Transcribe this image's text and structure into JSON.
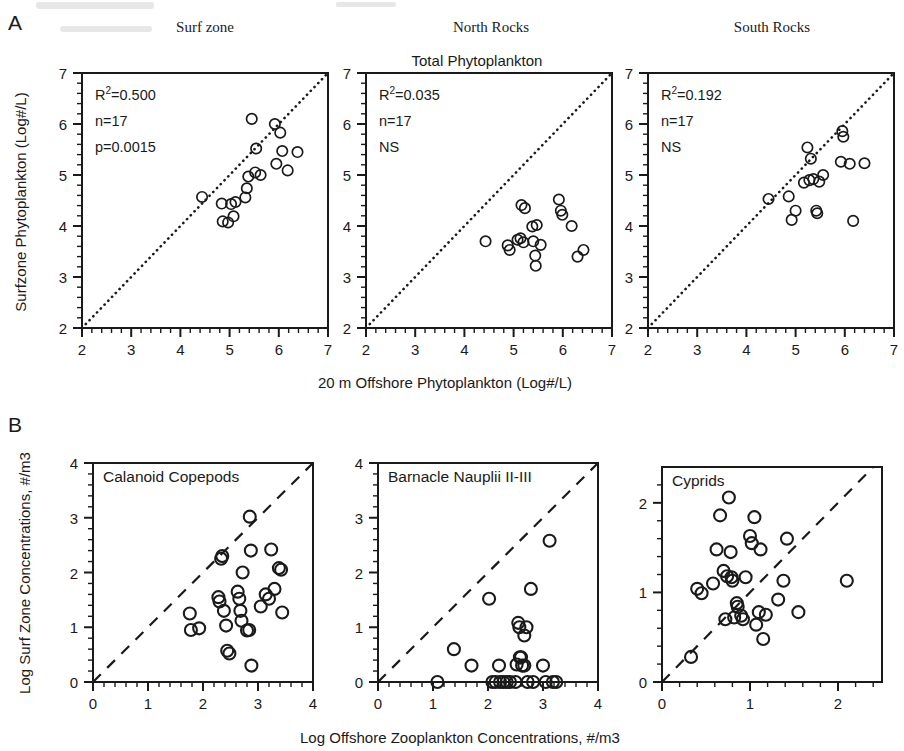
{
  "figure": {
    "panel_a_letter": "A",
    "panel_b_letter": "B",
    "accent_color": "#1a1a1a",
    "background_color": "#ffffff"
  },
  "chart_data": [
    {
      "id": "a1",
      "type": "scatter",
      "title": "Surf zone",
      "supra_title": "",
      "xlabel": "20 m Offshore Phytoplankton  (Log#/L)",
      "ylabel": "Surfzone Phytoplankton  (Log#/L)",
      "xlim": [
        2,
        7
      ],
      "ylim": [
        2,
        7
      ],
      "xticks": [
        2,
        3,
        4,
        5,
        6,
        7
      ],
      "yticks": [
        2,
        3,
        4,
        5,
        6,
        7
      ],
      "minor_ticks_per_interval": 5,
      "grid": false,
      "reference_line": {
        "style": "dotted",
        "from": [
          2,
          2
        ],
        "to": [
          7,
          7
        ],
        "label": "1:1 line"
      },
      "annotations": [
        "R2=0.500",
        "n=17",
        "p=0.0015"
      ],
      "stats": {
        "r_squared": "0.500",
        "n": "17",
        "p": "0.0015",
        "significance": ""
      },
      "points": [
        [
          4.44,
          4.57
        ],
        [
          4.84,
          4.44
        ],
        [
          4.86,
          4.09
        ],
        [
          4.97,
          4.07
        ],
        [
          5.03,
          4.43
        ],
        [
          5.08,
          4.19
        ],
        [
          5.12,
          4.47
        ],
        [
          5.32,
          4.56
        ],
        [
          5.35,
          4.74
        ],
        [
          5.38,
          4.97
        ],
        [
          5.45,
          6.1
        ],
        [
          5.52,
          5.05
        ],
        [
          5.54,
          5.52
        ],
        [
          5.63,
          5.0
        ],
        [
          5.92,
          6.0
        ],
        [
          5.95,
          5.22
        ],
        [
          6.03,
          5.83
        ],
        [
          6.07,
          5.47
        ],
        [
          6.18,
          5.09
        ],
        [
          6.38,
          5.45
        ]
      ]
    },
    {
      "id": "a2",
      "type": "scatter",
      "title": "North Rocks",
      "supra_title": "Total Phytoplankton",
      "xlabel": "20 m Offshore Phytoplankton  (Log#/L)",
      "ylabel": "",
      "xlim": [
        2,
        7
      ],
      "ylim": [
        2,
        7
      ],
      "xticks": [
        2,
        3,
        4,
        5,
        6,
        7
      ],
      "yticks": [
        2,
        3,
        4,
        5,
        6,
        7
      ],
      "minor_ticks_per_interval": 5,
      "grid": false,
      "reference_line": {
        "style": "dotted",
        "from": [
          2,
          2
        ],
        "to": [
          7,
          7
        ],
        "label": "1:1 line"
      },
      "annotations": [
        "R2=0.035",
        "n=17",
        "NS"
      ],
      "stats": {
        "r_squared": "0.035",
        "n": "17",
        "p": "",
        "significance": "NS"
      },
      "points": [
        [
          4.43,
          3.7
        ],
        [
          4.88,
          3.62
        ],
        [
          4.92,
          3.53
        ],
        [
          5.08,
          3.73
        ],
        [
          5.14,
          3.76
        ],
        [
          5.16,
          4.41
        ],
        [
          5.23,
          4.35
        ],
        [
          5.2,
          3.68
        ],
        [
          5.38,
          3.99
        ],
        [
          5.47,
          4.02
        ],
        [
          5.4,
          3.7
        ],
        [
          5.44,
          3.42
        ],
        [
          5.45,
          3.22
        ],
        [
          5.55,
          3.63
        ],
        [
          5.92,
          4.52
        ],
        [
          5.96,
          4.3
        ],
        [
          5.99,
          4.22
        ],
        [
          6.18,
          4.0
        ],
        [
          6.3,
          3.4
        ],
        [
          6.42,
          3.53
        ]
      ]
    },
    {
      "id": "a3",
      "type": "scatter",
      "title": "South Rocks",
      "supra_title": "",
      "xlabel": "20 m Offshore Phytoplankton  (Log#/L)",
      "ylabel": "",
      "xlim": [
        2,
        7
      ],
      "ylim": [
        2,
        7
      ],
      "xticks": [
        2,
        3,
        4,
        5,
        6,
        7
      ],
      "yticks": [
        2,
        3,
        4,
        5,
        6,
        7
      ],
      "minor_ticks_per_interval": 5,
      "grid": false,
      "reference_line": {
        "style": "dotted",
        "from": [
          2,
          2
        ],
        "to": [
          7,
          7
        ],
        "label": "1:1 line"
      },
      "annotations": [
        "R2=0.192",
        "n=17",
        "NS"
      ],
      "stats": {
        "r_squared": "0.192",
        "n": "17",
        "p": "",
        "significance": "NS"
      },
      "points": [
        [
          4.45,
          4.53
        ],
        [
          4.86,
          4.58
        ],
        [
          4.92,
          4.12
        ],
        [
          5.0,
          4.3
        ],
        [
          5.17,
          4.85
        ],
        [
          5.24,
          5.54
        ],
        [
          5.28,
          4.9
        ],
        [
          5.31,
          5.32
        ],
        [
          5.36,
          4.92
        ],
        [
          5.42,
          4.3
        ],
        [
          5.44,
          4.25
        ],
        [
          5.48,
          4.87
        ],
        [
          5.56,
          5.0
        ],
        [
          5.95,
          5.86
        ],
        [
          5.97,
          5.75
        ],
        [
          5.92,
          5.26
        ],
        [
          6.1,
          5.22
        ],
        [
          6.17,
          4.1
        ],
        [
          6.4,
          5.23
        ]
      ]
    },
    {
      "id": "b1",
      "type": "scatter",
      "title": "Calanoid Copepods",
      "supra_title": "",
      "xlabel": "Log Offshore Zooplankton Concentrations, #/m3",
      "ylabel": "Log Surf Zone Concentrations, #/m3",
      "xlim": [
        0,
        4
      ],
      "ylim": [
        0,
        4
      ],
      "xticks": [
        0,
        1,
        2,
        3,
        4
      ],
      "yticks": [
        0,
        1,
        2,
        3,
        4
      ],
      "minor_ticks_per_interval": 5,
      "grid": false,
      "reference_line": {
        "style": "dashed",
        "from": [
          0,
          0
        ],
        "to": [
          4,
          4
        ],
        "label": "1:1 line"
      },
      "annotations": [],
      "stats": {},
      "points": [
        [
          1.76,
          1.25
        ],
        [
          1.78,
          0.95
        ],
        [
          1.93,
          0.98
        ],
        [
          2.28,
          1.55
        ],
        [
          2.3,
          1.47
        ],
        [
          2.33,
          2.25
        ],
        [
          2.35,
          2.3
        ],
        [
          2.38,
          1.3
        ],
        [
          2.42,
          1.03
        ],
        [
          2.44,
          0.57
        ],
        [
          2.48,
          0.52
        ],
        [
          2.63,
          1.65
        ],
        [
          2.66,
          1.52
        ],
        [
          2.68,
          1.3
        ],
        [
          2.7,
          1.12
        ],
        [
          2.72,
          2.0
        ],
        [
          2.8,
          0.94
        ],
        [
          2.84,
          0.95
        ],
        [
          2.85,
          3.02
        ],
        [
          2.87,
          2.4
        ],
        [
          2.88,
          0.3
        ],
        [
          3.05,
          1.38
        ],
        [
          3.14,
          1.6
        ],
        [
          3.2,
          1.52
        ],
        [
          3.24,
          2.42
        ],
        [
          3.3,
          1.7
        ],
        [
          3.38,
          2.08
        ],
        [
          3.42,
          2.05
        ],
        [
          3.44,
          1.27
        ]
      ]
    },
    {
      "id": "b2",
      "type": "scatter",
      "title": "Barnacle Nauplii II-III",
      "supra_title": "",
      "xlabel": "Log Offshore Zooplankton Concentrations, #/m3",
      "ylabel": "",
      "xlim": [
        0,
        4
      ],
      "ylim": [
        0,
        4
      ],
      "xticks": [
        0,
        1,
        2,
        3,
        4
      ],
      "yticks": [
        0,
        1,
        2,
        3,
        4
      ],
      "minor_ticks_per_interval": 5,
      "grid": false,
      "reference_line": {
        "style": "dashed",
        "from": [
          0,
          0
        ],
        "to": [
          4,
          4
        ],
        "label": "1:1 line"
      },
      "annotations": [],
      "stats": {},
      "points": [
        [
          1.08,
          0.0
        ],
        [
          1.38,
          0.6
        ],
        [
          1.7,
          0.3
        ],
        [
          2.02,
          1.52
        ],
        [
          2.08,
          0.0
        ],
        [
          2.14,
          0.0
        ],
        [
          2.2,
          0.3
        ],
        [
          2.22,
          0.0
        ],
        [
          2.28,
          0.0
        ],
        [
          2.34,
          0.0
        ],
        [
          2.4,
          0.0
        ],
        [
          2.5,
          0.0
        ],
        [
          2.52,
          0.32
        ],
        [
          2.55,
          1.08
        ],
        [
          2.57,
          1.0
        ],
        [
          2.58,
          0.45
        ],
        [
          2.6,
          0.45
        ],
        [
          2.62,
          0.3
        ],
        [
          2.66,
          0.3
        ],
        [
          2.66,
          0.85
        ],
        [
          2.7,
          1.0
        ],
        [
          2.72,
          0.0
        ],
        [
          2.78,
          1.7
        ],
        [
          2.82,
          0.0
        ],
        [
          3.0,
          0.3
        ],
        [
          3.05,
          0.0
        ],
        [
          3.12,
          2.58
        ],
        [
          3.18,
          0.0
        ],
        [
          3.24,
          0.0
        ]
      ]
    },
    {
      "id": "b3",
      "type": "scatter",
      "title": "Cyprids",
      "supra_title": "",
      "xlabel": "Log Offshore Zooplankton Concentrations, #/m3",
      "ylabel": "",
      "xlim": [
        0,
        2.5
      ],
      "ylim": [
        0,
        2.4
      ],
      "xticks": [
        0,
        1,
        2
      ],
      "yticks": [
        0,
        1,
        2
      ],
      "minor_ticks_per_interval": 5,
      "grid": false,
      "reference_line": {
        "style": "dashed",
        "from": [
          0,
          0
        ],
        "to": [
          2.4,
          2.4
        ],
        "label": "1:1 line"
      },
      "annotations": [],
      "stats": {},
      "points": [
        [
          0.33,
          0.28
        ],
        [
          0.4,
          1.04
        ],
        [
          0.45,
          0.99
        ],
        [
          0.58,
          1.1
        ],
        [
          0.62,
          1.48
        ],
        [
          0.66,
          1.86
        ],
        [
          0.7,
          1.24
        ],
        [
          0.72,
          0.7
        ],
        [
          0.74,
          1.18
        ],
        [
          0.76,
          2.06
        ],
        [
          0.78,
          1.45
        ],
        [
          0.79,
          1.17
        ],
        [
          0.8,
          1.13
        ],
        [
          0.82,
          0.72
        ],
        [
          0.85,
          0.88
        ],
        [
          0.86,
          0.84
        ],
        [
          0.9,
          0.74
        ],
        [
          0.92,
          0.7
        ],
        [
          0.95,
          1.17
        ],
        [
          1.0,
          1.63
        ],
        [
          1.02,
          1.55
        ],
        [
          1.05,
          1.84
        ],
        [
          1.07,
          0.64
        ],
        [
          1.1,
          0.78
        ],
        [
          1.12,
          1.48
        ],
        [
          1.15,
          0.48
        ],
        [
          1.18,
          0.75
        ],
        [
          1.32,
          0.92
        ],
        [
          1.38,
          1.13
        ],
        [
          1.42,
          1.6
        ],
        [
          1.55,
          0.78
        ],
        [
          2.1,
          1.13
        ]
      ]
    }
  ]
}
